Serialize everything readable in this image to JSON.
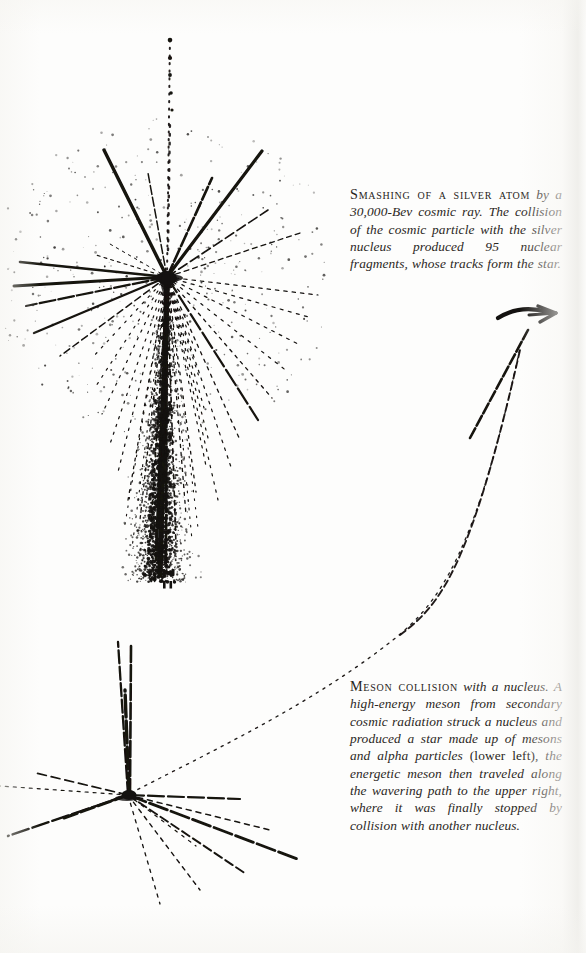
{
  "page": {
    "background_color": "#fdfdfc",
    "ink_color": "#141210",
    "width": 586,
    "height": 953
  },
  "figures": [
    {
      "id": "silver-atom-star",
      "name": "cosmic-ray-star-photomicrograph",
      "description": "Nuclear emulsion photomicrograph of a star: many straight grain tracks radiating from a single vertex, with a dense downward jet.",
      "vertex": {
        "x": 167,
        "y": 277
      },
      "track_count": 95
    },
    {
      "id": "meson-collision-star",
      "name": "meson-collision-photomicrograph",
      "description": "Nuclear emulsion photomicrograph of a meson-induced star at lower left with a long wavering dotted meson track running to the upper right, ending in a bold arrow.",
      "vertex": {
        "x": 128,
        "y": 795
      },
      "arrow_tip": {
        "x": 556,
        "y": 313
      }
    }
  ],
  "captions": {
    "silver": {
      "lead": "Smashing of a silver atom",
      "body": " by a 30,000-Bev cosmic ray. The collision of the cosmic particle with the silver nucleus produced 95 nuclear fragments, whose tracks form the star."
    },
    "meson": {
      "lead": "Meson collision",
      "body_1": " with a nucleus. A high-energy meson from secondary cosmic radiation struck a nucleus and produced a star made up of mesons and alpha particles ",
      "parenthetical": "(lower left)",
      "body_2": ", the energetic meson then traveled along the wavering path to the upper right, where it was finally stopped by collision with another nucleus."
    }
  }
}
